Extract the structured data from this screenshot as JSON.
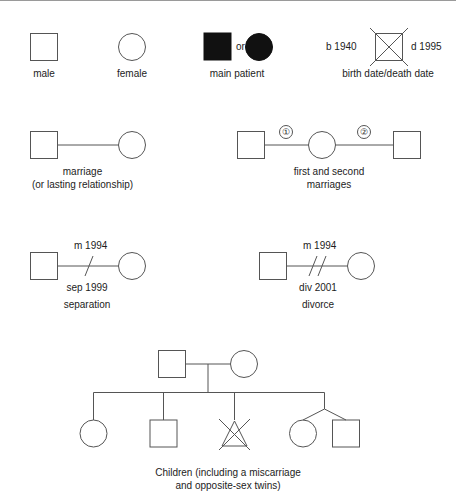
{
  "diagram": {
    "stroke_color": "#555555",
    "fill_color": "#111111",
    "background": "#ffffff"
  },
  "legend_row1": {
    "male": {
      "label": "male",
      "symbol": "square-outline"
    },
    "female": {
      "label": "female",
      "symbol": "circle-outline"
    },
    "main_patient": {
      "label": "main patient",
      "conjunction": "or",
      "symbols": [
        "square-filled",
        "circle-filled"
      ]
    },
    "dates": {
      "label": "birth date/death date",
      "birth": "b 1940",
      "death": "d 1995",
      "symbol": "square-crossed"
    }
  },
  "legend_row2": {
    "marriage": {
      "line1": "marriage",
      "line2": "(or lasting relationship)"
    },
    "multiple_marriages": {
      "line1": "first and second",
      "line2": "marriages",
      "marker_first": "①",
      "marker_second": "②"
    }
  },
  "legend_row3": {
    "separation": {
      "married": "m 1994",
      "event": "sep 1999",
      "label": "separation",
      "marker": "single-slash"
    },
    "divorce": {
      "married": "m 1994",
      "event": "div 2001",
      "label": "divorce",
      "marker": "double-slash"
    }
  },
  "legend_row4": {
    "caption_line1": "Children (including a miscarriage",
    "caption_line2": "and opposite-sex twins)",
    "parents": [
      "square-outline",
      "circle-outline"
    ],
    "children": [
      "circle-outline",
      "square-outline",
      "triangle-crossed-miscarriage",
      "circle-outline",
      "square-outline"
    ]
  }
}
